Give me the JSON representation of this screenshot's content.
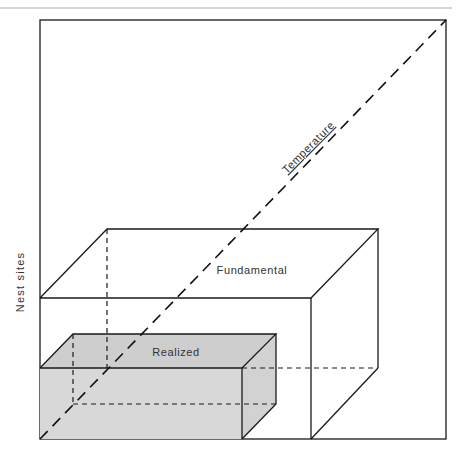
{
  "diagram": {
    "type": "niche-box-diagram",
    "axes": {
      "vertical_label": "Nest sites",
      "diagonal_label": "Temperature"
    },
    "boxes": [
      {
        "name": "fundamental",
        "label": "Fundamental",
        "fill": "#ffffff"
      },
      {
        "name": "realized",
        "label": "Realized",
        "fill": "#d8d8d8",
        "top_fill": "#cecece"
      }
    ],
    "colors": {
      "line": "#1a1a1a",
      "top_rule": "#b0b0b0",
      "text": "#333333"
    }
  }
}
